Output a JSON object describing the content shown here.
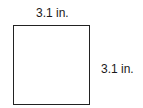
{
  "figure": {
    "shape": "square",
    "top_side_label": "3.1 in.",
    "right_side_label": "3.1 in.",
    "stroke_color": "#222222",
    "fill_color": "#ffffff"
  }
}
